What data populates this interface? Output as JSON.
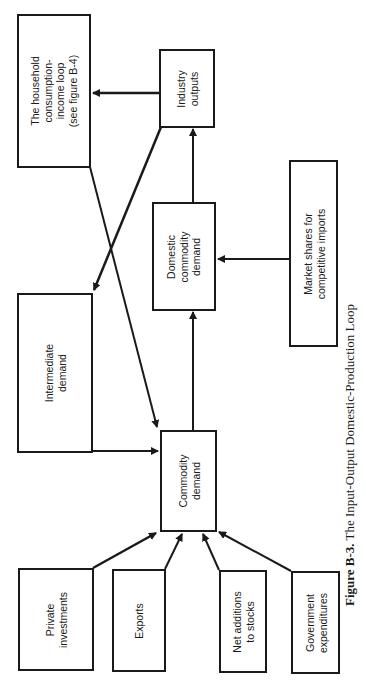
{
  "figure": {
    "number": "Figure B-3.",
    "title": "The Input-Output Domestic-Production Loop"
  },
  "nodes": {
    "household": {
      "label": "The household\nconsumption-\nincome loop\n(see figure B-4)"
    },
    "industry_outputs": {
      "label": "Industry\noutputs"
    },
    "domestic_commodity_demand": {
      "label": "Domestic\ncommodity\ndemand"
    },
    "market_shares": {
      "label": "Market shares for\ncompetitive imports"
    },
    "intermediate_demand": {
      "label": "Intermediate\ndemand"
    },
    "commodity_demand": {
      "label": "Commodity\ndemand"
    },
    "private_investments": {
      "label": "Private\ninvestments"
    },
    "exports": {
      "label": "Exports"
    },
    "net_additions": {
      "label": "Net additions\nto stocks"
    },
    "government_expenditures": {
      "label": "Government\nexpenditures"
    }
  },
  "edges": [
    {
      "from": "Private investments",
      "to": "Commodity demand"
    },
    {
      "from": "Exports",
      "to": "Commodity demand"
    },
    {
      "from": "Net additions to stocks",
      "to": "Commodity demand"
    },
    {
      "from": "Government expenditures",
      "to": "Commodity demand"
    },
    {
      "from": "Intermediate demand",
      "to": "Commodity demand"
    },
    {
      "from": "The household consumption-income loop",
      "to": "Commodity demand"
    },
    {
      "from": "Commodity demand",
      "to": "Domestic commodity demand"
    },
    {
      "from": "Market shares for competitive imports",
      "to": "Domestic commodity demand"
    },
    {
      "from": "Domestic commodity demand",
      "to": "Industry outputs"
    },
    {
      "from": "Industry outputs",
      "to": "The household consumption-income loop"
    },
    {
      "from": "Industry outputs",
      "to": "Intermediate demand"
    }
  ],
  "colors": {
    "ink": "#1a1a1a",
    "paper": "#ffffff"
  }
}
